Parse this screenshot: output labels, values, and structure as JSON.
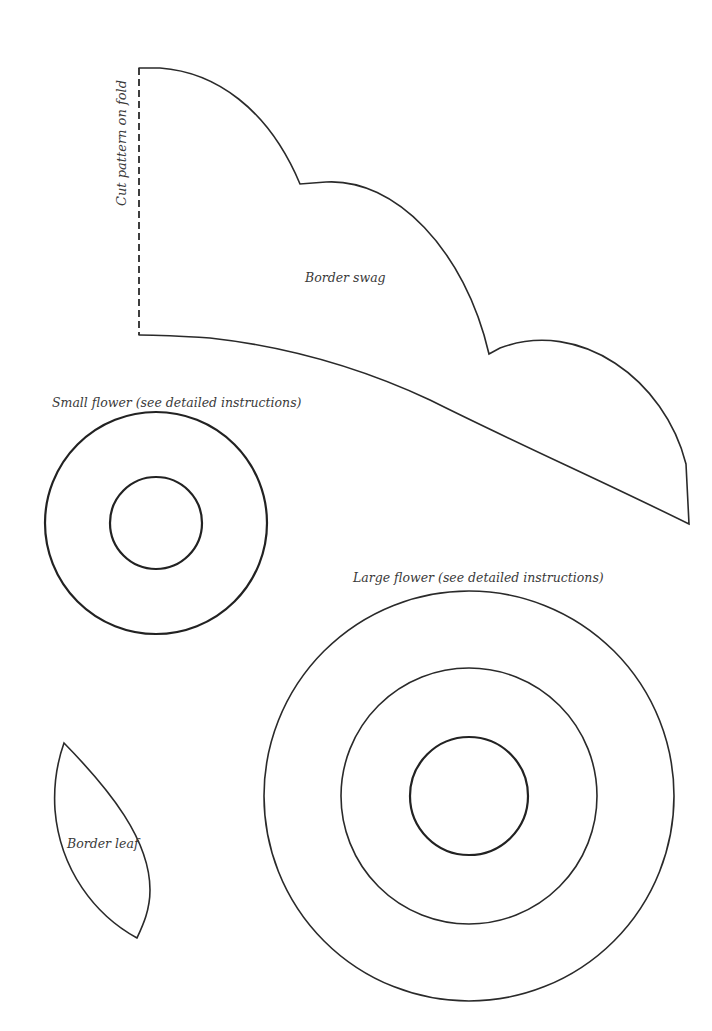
{
  "page": {
    "background": "#ffffff",
    "line_color": "#2a2a2a"
  },
  "patterns": {
    "border_swag": {
      "label": "Border swag",
      "fold_label": "Cut pattern on fold"
    },
    "small_flower": {
      "label": "Small flower (see detailed instructions)",
      "rings": 2
    },
    "large_flower": {
      "label": "Large flower (see detailed instructions)",
      "rings": 3
    },
    "border_leaf": {
      "label": "Border leaf"
    }
  }
}
